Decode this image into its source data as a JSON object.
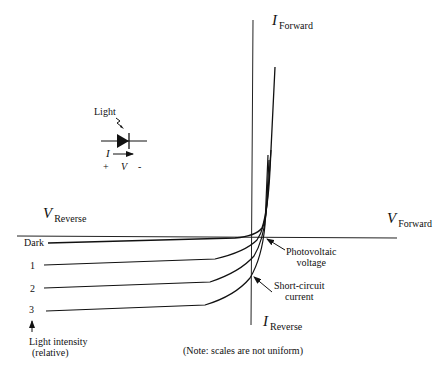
{
  "diagram": {
    "type": "photodiode-iv-characteristic",
    "axes": {
      "i_forward": {
        "symbol": "I",
        "subscript": "Forward"
      },
      "i_reverse": {
        "symbol": "I",
        "subscript": "Reverse"
      },
      "v_forward": {
        "symbol": "V",
        "subscript": "Forward"
      },
      "v_reverse": {
        "symbol": "V",
        "subscript": "Reverse"
      }
    },
    "symbol_inset": {
      "light_label": "Light",
      "current_label": "I",
      "voltage_label": "V",
      "plus_label": "+",
      "minus_label": "-"
    },
    "curves": [
      {
        "label": "Dark"
      },
      {
        "label": "1"
      },
      {
        "label": "2"
      },
      {
        "label": "3"
      }
    ],
    "light_intensity_label_line1": "Light intensity",
    "light_intensity_label_line2": "(relative)",
    "annotations": {
      "photovoltaic_line1": "Photovoltaic",
      "photovoltaic_line2": "voltage",
      "short_circuit_line1": "Short-circuit",
      "short_circuit_line2": "current"
    },
    "note": "(Note: scales are not uniform)"
  }
}
